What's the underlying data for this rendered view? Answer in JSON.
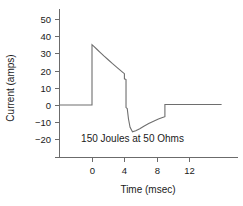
{
  "chart_data": {
    "type": "line",
    "title": "",
    "xlabel": "Time (msec)",
    "ylabel": "Current (amps)",
    "xlim": [
      -4,
      16
    ],
    "ylim": [
      -25,
      50
    ],
    "xticks": [
      0,
      4,
      8,
      12
    ],
    "xticklabels": [
      "0",
      "4",
      "8",
      "12"
    ],
    "yticks": [
      -20,
      -10,
      0,
      10,
      20,
      30,
      40,
      50
    ],
    "yticklabels": [
      "−20",
      "−10",
      "0",
      "10",
      "20",
      "30",
      "40",
      "50"
    ],
    "grid": false,
    "legend": null,
    "annotations": [
      {
        "text": "150 Joules at 50 Ohms",
        "x": 5.0,
        "y": -21.5
      }
    ],
    "line_color": "#6e6e6e",
    "series": [
      {
        "name": "Biphasic defibrillation current",
        "x": [
          -4.0,
          0.0,
          0.0,
          0.2,
          0.6,
          1.0,
          1.5,
          2.0,
          2.5,
          3.0,
          3.4,
          3.8,
          4.0,
          4.0,
          4.2,
          4.2,
          4.35,
          4.5,
          4.7,
          5.0,
          5.4,
          5.9,
          6.4,
          7.0,
          7.6,
          8.2,
          8.7,
          9.0,
          9.0,
          9.2,
          11.0,
          13.0,
          15.0,
          16.0
        ],
        "y": [
          0.0,
          0.0,
          35.0,
          34.2,
          32.4,
          30.6,
          28.4,
          26.3,
          24.2,
          22.2,
          20.6,
          19.0,
          18.2,
          15.2,
          14.8,
          -1.5,
          -2.0,
          -8.0,
          -13.0,
          -15.6,
          -15.0,
          -13.8,
          -12.4,
          -10.8,
          -9.4,
          -8.2,
          -7.3,
          -6.8,
          0.3,
          0.3,
          0.3,
          0.3,
          0.3,
          0.3
        ]
      }
    ]
  }
}
